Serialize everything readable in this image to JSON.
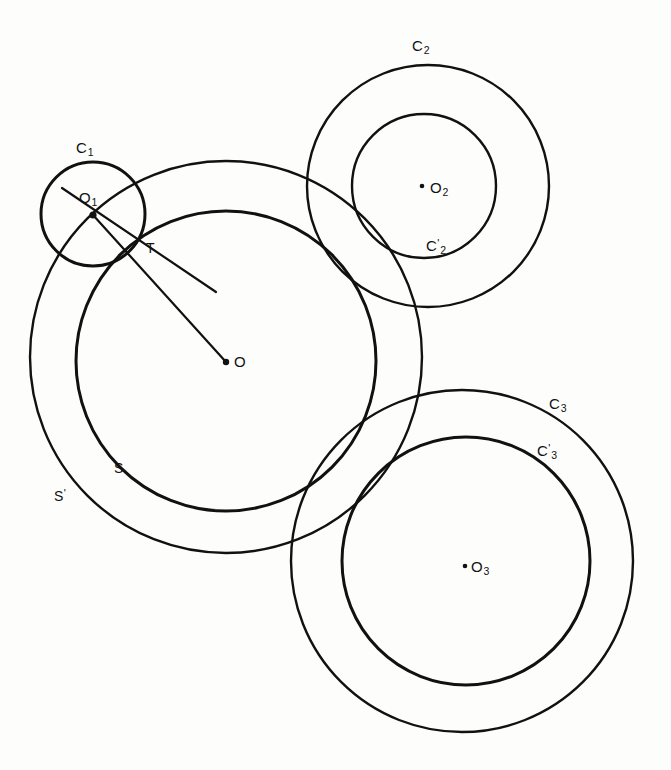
{
  "figure": {
    "background_color": "#fdfdfc",
    "stroke_color": "#111111"
  },
  "labels": {
    "c1": "C",
    "c1_sub": "1",
    "o1": "O",
    "o1_sub": "1",
    "t": "T",
    "o": "O",
    "s": "S",
    "s_prime": "S",
    "s_prime_mark": "'",
    "c2": "C",
    "c2_sub": "2",
    "c2_prime": "C",
    "c2_prime_mark": "'",
    "c2_prime_sub": "2",
    "o2": "O",
    "o2_sub": "2",
    "c3": "C",
    "c3_sub": "3",
    "c3_prime": "C",
    "c3_prime_mark": "'",
    "c3_prime_sub": "3",
    "o3": "O",
    "o3_sub": "3"
  },
  "geometry": {
    "circles": [
      {
        "name": "S",
        "cx": 226,
        "cy": 361,
        "r": 150,
        "role": "inner-boundary-of-annulus"
      },
      {
        "name": "S'",
        "cx": 226,
        "cy": 357,
        "r": 196,
        "role": "outer-boundary-of-annulus"
      },
      {
        "name": "C1",
        "cx": 93,
        "cy": 214,
        "r": 52,
        "role": "small-tangent-circle"
      },
      {
        "name": "C2",
        "cx": 428,
        "cy": 186,
        "r": 121,
        "role": "outer-circle-2"
      },
      {
        "name": "C'2",
        "cx": 424,
        "cy": 186,
        "r": 72,
        "role": "inner-circle-2"
      },
      {
        "name": "C3",
        "cx": 462,
        "cy": 561,
        "r": 171,
        "role": "outer-circle-3"
      },
      {
        "name": "C'3",
        "cx": 466,
        "cy": 561,
        "r": 124,
        "role": "inner-circle-3"
      }
    ],
    "points": [
      {
        "name": "O",
        "x": 226,
        "y": 362
      },
      {
        "name": "O1",
        "x": 93,
        "y": 215
      },
      {
        "name": "O2",
        "x": 424,
        "y": 186
      },
      {
        "name": "O3",
        "x": 466,
        "y": 565
      },
      {
        "name": "T",
        "x": 140,
        "y": 251
      }
    ],
    "segments": [
      {
        "name": "O1-O",
        "from": "O1",
        "to": "O"
      },
      {
        "name": "O1-T-extended",
        "from": [
          63,
          190
        ],
        "to": [
          213,
          290
        ]
      }
    ]
  }
}
